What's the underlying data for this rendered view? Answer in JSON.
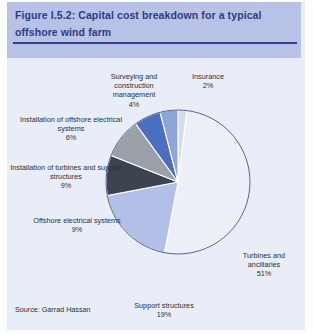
{
  "figure": {
    "title": "Figure I.5.2: Capital cost breakdown for a typical offshore wind farm",
    "source": "Source: Garrad Hassan"
  },
  "labels": {
    "surveying": "Surveying and construction management\n4%",
    "insurance": "Insurance\n2%",
    "installation_offshore_electrical": "Installation of offshore electrical systems\n6%",
    "installation_turbines": "Installation of turbines and support structures\n9%",
    "offshore_electrical": "Offshore electrical systems\n9%",
    "support_structures": "Support structures\n19%",
    "turbines": "Turbines and ancillaries\n51%"
  },
  "colors": {
    "header_band": "#b7c2e6",
    "panel_background": "#e8edf8",
    "title_text": "#2e3a85",
    "title_rule": "#353f87",
    "slice_outline": "#3f4a86",
    "label_text": "#2b2f3c"
  },
  "chart_data": {
    "type": "pie",
    "title": "Capital cost breakdown for a typical offshore wind farm",
    "units": "percent",
    "start_angle_deg": 0,
    "direction": "clockwise",
    "legend": "none (direct labels)",
    "categories": [
      "Insurance",
      "Turbines and ancillaries",
      "Support structures",
      "Offshore electrical systems",
      "Installation of turbines and support structures",
      "Installation of offshore electrical systems",
      "Surveying and construction management"
    ],
    "values": [
      2,
      51,
      19,
      9,
      9,
      6,
      4
    ],
    "slice_colors": [
      "#d6dcf0",
      "#edeff8",
      "#b2c0e8",
      "#3d4450",
      "#9aa0a8",
      "#4a6fc0",
      "#8fa5d8"
    ],
    "total": 100
  }
}
